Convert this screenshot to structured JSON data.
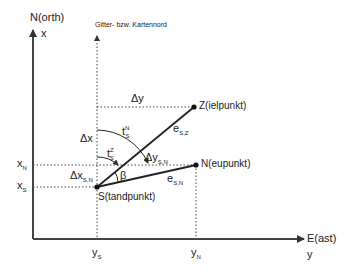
{
  "diagram": {
    "axes": {
      "north_label": "N(orth)",
      "north_symbol": "x",
      "east_label": "E(ast)",
      "east_symbol": "y",
      "grid_north_label": "Gitter- bzw. Kartennord"
    },
    "points": {
      "station": "S(tandpunkt)",
      "target": "Z(ielpunkt)",
      "new_point": "N(eupunkt)"
    },
    "labels": {
      "delta_y": "Δy",
      "delta_x": "Δx",
      "delta_y_sn": {
        "base": "Δy",
        "sub": "S,N"
      },
      "delta_x_sn": {
        "base": "Δx",
        "sub": "S,N"
      },
      "t_s_n": {
        "base": "t",
        "sub": "S",
        "sup": "N"
      },
      "t_s_z": {
        "base": "t",
        "sub": "S",
        "sup": "Z"
      },
      "e_sz": {
        "base": "e",
        "sub": "S,Z"
      },
      "e_sn": {
        "base": "e",
        "sub": "S,N"
      },
      "beta": "β",
      "x_n": {
        "base": "x",
        "sub": "N"
      },
      "x_s": {
        "base": "x",
        "sub": "S"
      },
      "y_s": {
        "base": "y",
        "sub": "S"
      },
      "y_n": {
        "base": "y",
        "sub": "N"
      }
    },
    "colors": {
      "line": "#333333",
      "dotted": "#444444"
    }
  }
}
